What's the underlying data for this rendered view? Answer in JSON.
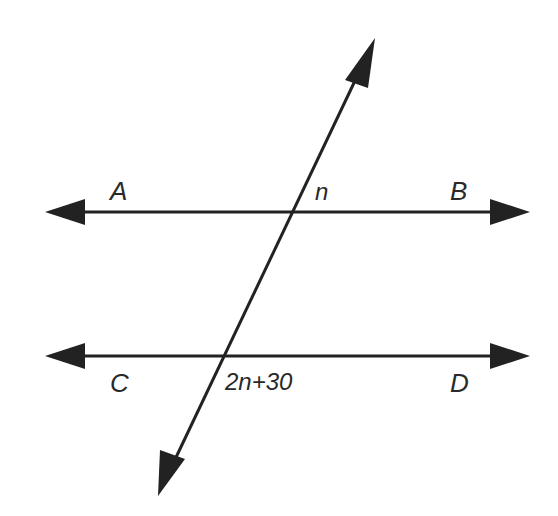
{
  "diagram": {
    "type": "parallel-lines-transversal",
    "points": {
      "A": "A",
      "B": "B",
      "C": "C",
      "D": "D"
    },
    "angles": {
      "upper": "n",
      "lower": "2n+30"
    },
    "colors": {
      "line": "#222222",
      "text": "#2a2a2a",
      "background": "#ffffff"
    }
  }
}
